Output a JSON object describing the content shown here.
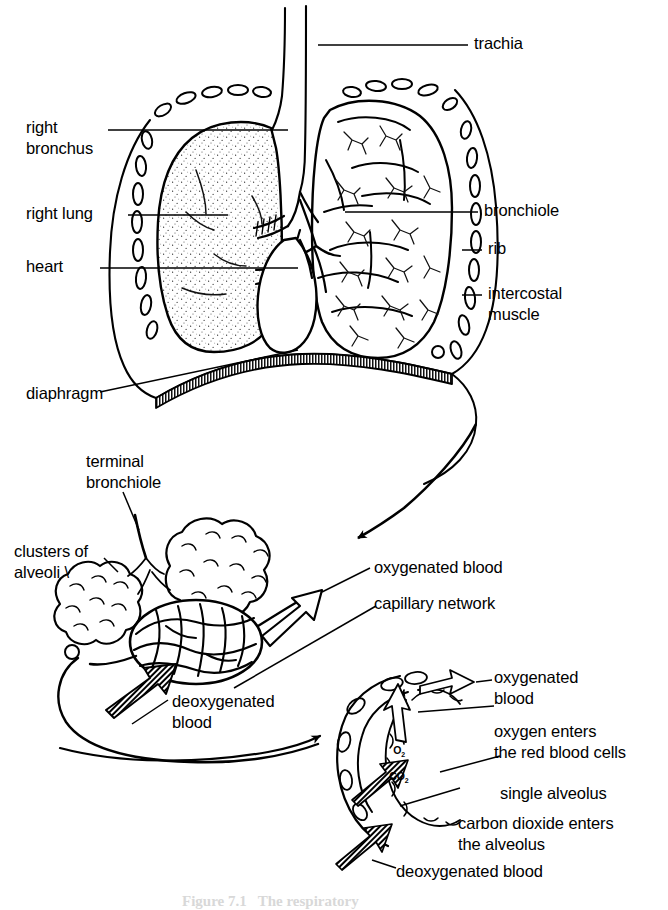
{
  "figure": {
    "style": "black-and-white line drawing",
    "background_color": "#ffffff",
    "ink_color": "#000000"
  },
  "thorax": {
    "labels": {
      "trachea": "trachia",
      "right_bronchus_line1": "right",
      "right_bronchus_line2": "bronchus",
      "right_lung": "right lung",
      "heart": "heart",
      "diaphragm": "diaphragm",
      "bronchiole": "bronchiole",
      "rib": "rib",
      "intercostal_line1": "intercostal",
      "intercostal_line2": "muscle"
    }
  },
  "alveoli_detail": {
    "labels": {
      "terminal_bronchiole_line1": "terminal",
      "terminal_bronchiole_line2": "bronchiole",
      "clusters_line1": "clusters of",
      "clusters_line2": "alveoli \\",
      "oxygenated_blood": "oxygenated blood",
      "capillary_network": "capillary network",
      "deoxygenated_line1": "deoxygenated",
      "deoxygenated_line2": "blood"
    }
  },
  "alveolus_detail": {
    "labels": {
      "oxygenated_line1": "oxygenated",
      "oxygenated_line2": "blood",
      "oxygen_enters_line1": "oxygen enters",
      "oxygen_enters_line2": "the red blood cells",
      "single_alveolus": "single alveolus",
      "co2_enters_line1": "carbon dioxide enters",
      "co2_enters_line2": "the alveolus",
      "deoxygenated_blood": "deoxygenated blood"
    },
    "gas_labels": {
      "oxygen_formula": "O",
      "oxygen_subscript": "2",
      "carbon_dioxide_formula": "CO",
      "carbon_dioxide_subscript": "2"
    }
  },
  "caption": {
    "text": "Figure 7.1   The respiratory"
  }
}
